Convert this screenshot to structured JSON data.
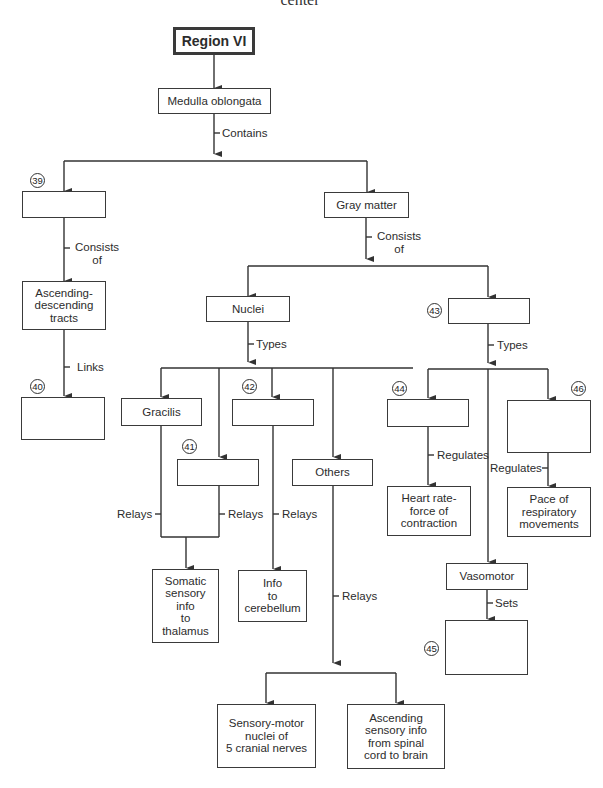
{
  "header": {
    "cut_text": "center"
  },
  "nodes": {
    "region": "Region VI",
    "medulla": "Medulla oblongata",
    "blank39": "",
    "gray_matter": "Gray matter",
    "tracts": "Ascending-\ndescending\ntracts",
    "blank40": "",
    "nuclei": "Nuclei",
    "blank43": "",
    "gracilis": "Gracilis",
    "blank41": "",
    "blank42": "",
    "others": "Others",
    "blank44": "",
    "blank46": "",
    "heart": "Heart rate-\nforce of\ncontraction",
    "pace": "Pace of\nrespiratory\nmovements",
    "vasomotor": "Vasomotor",
    "blank45": "",
    "somatic": "Somatic\nsensory\ninfo\nto\nthalamus",
    "cerebellum": "Info\nto\ncerebellum",
    "sensory_motor": "Sensory-motor\nnuclei of\n5 cranial nerves",
    "ascending_info": "Ascending\nsensory info\nfrom spinal\ncord to brain"
  },
  "labels": {
    "contains": "Contains",
    "consists_left": "Consists\nof",
    "consists_right": "Consists\nof",
    "links": "Links",
    "types_nuclei": "Types",
    "types_43": "Types",
    "relays_gracilis": "Relays",
    "relays_41": "Relays",
    "relays_42": "Relays",
    "relays_others": "Relays",
    "regulates_44": "Regulates",
    "regulates_46": "Regulates",
    "sets": "Sets"
  },
  "numbers": {
    "n39": "39",
    "n40": "40",
    "n41": "41",
    "n42": "42",
    "n43": "43",
    "n44": "44",
    "n45": "45",
    "n46": "46"
  }
}
